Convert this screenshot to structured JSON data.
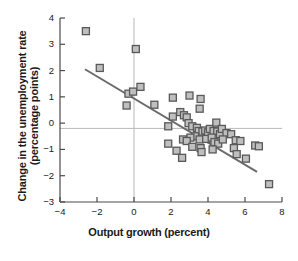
{
  "chart_data": {
    "type": "scatter",
    "title": "",
    "xlabel": "Output growth (percent)",
    "ylabel": "Change in the unemployment rate\n(percentage points)",
    "xlim": [
      -4,
      8
    ],
    "ylim": [
      -3,
      4
    ],
    "xticks": [
      -4,
      -2,
      0,
      2,
      4,
      6,
      8
    ],
    "yticks": [
      4,
      3,
      2,
      1,
      0,
      -1,
      -2,
      -3
    ],
    "xtick_labels": [
      "−4",
      "−2",
      "0",
      "2",
      "4",
      "6",
      "8"
    ],
    "ytick_labels": [
      "4",
      "3",
      "2",
      "1",
      "0",
      "−1",
      "−2",
      "−3"
    ],
    "grid": false,
    "reference_lines": [
      {
        "name": "vertical-zero-line",
        "orientation": "vertical",
        "value": 0
      },
      {
        "name": "horizontal-zero-line",
        "orientation": "horizontal",
        "value": -0.2
      }
    ],
    "legend": [],
    "marker": {
      "shape": "square",
      "fill_color": "#bfbfbf",
      "edge_color": "#595959",
      "size_px": 7
    },
    "trend_line": {
      "name": "regression-line",
      "color": "#6b6b6b",
      "width_px": 2,
      "x_start": -2.65,
      "y_start": 2.05,
      "x_end": 6.65,
      "y_end": -1.85
    },
    "points": [
      {
        "x": -2.6,
        "y": 3.5
      },
      {
        "x": -1.85,
        "y": 2.1
      },
      {
        "x": 0.1,
        "y": 2.82
      },
      {
        "x": -0.3,
        "y": 1.12
      },
      {
        "x": -0.05,
        "y": 1.2
      },
      {
        "x": 0.35,
        "y": 1.38
      },
      {
        "x": -0.4,
        "y": 0.67
      },
      {
        "x": 1.1,
        "y": 0.7
      },
      {
        "x": 2.1,
        "y": 0.97
      },
      {
        "x": 3.0,
        "y": 1.05
      },
      {
        "x": 3.6,
        "y": 0.92
      },
      {
        "x": 3.55,
        "y": 0.55
      },
      {
        "x": 2.1,
        "y": 0.25
      },
      {
        "x": 2.5,
        "y": 0.42
      },
      {
        "x": 2.7,
        "y": 0.3
      },
      {
        "x": 2.85,
        "y": 0.22
      },
      {
        "x": 1.85,
        "y": -0.12
      },
      {
        "x": 2.95,
        "y": 0.0
      },
      {
        "x": 3.15,
        "y": -0.12
      },
      {
        "x": 3.4,
        "y": -0.18
      },
      {
        "x": 3.5,
        "y": -0.3
      },
      {
        "x": 3.7,
        "y": -0.32
      },
      {
        "x": 3.85,
        "y": -0.28
      },
      {
        "x": 4.0,
        "y": -0.35
      },
      {
        "x": 4.1,
        "y": -0.22
      },
      {
        "x": 4.3,
        "y": -0.3
      },
      {
        "x": 4.45,
        "y": 0.02
      },
      {
        "x": 4.5,
        "y": -0.32
      },
      {
        "x": 4.65,
        "y": -0.42
      },
      {
        "x": 4.75,
        "y": -0.22
      },
      {
        "x": 5.0,
        "y": -0.38
      },
      {
        "x": 5.25,
        "y": -0.42
      },
      {
        "x": 3.3,
        "y": -0.5
      },
      {
        "x": 3.05,
        "y": -0.55
      },
      {
        "x": 2.65,
        "y": -0.62
      },
      {
        "x": 2.85,
        "y": -0.68
      },
      {
        "x": 3.55,
        "y": -0.62
      },
      {
        "x": 3.9,
        "y": -0.6
      },
      {
        "x": 4.2,
        "y": -0.55
      },
      {
        "x": 4.35,
        "y": -0.72
      },
      {
        "x": 4.55,
        "y": -0.78
      },
      {
        "x": 4.8,
        "y": -0.62
      },
      {
        "x": 5.5,
        "y": -0.65
      },
      {
        "x": 5.75,
        "y": -0.68
      },
      {
        "x": 6.55,
        "y": -0.85
      },
      {
        "x": 6.75,
        "y": -0.88
      },
      {
        "x": 1.85,
        "y": -0.78
      },
      {
        "x": 2.3,
        "y": -1.05
      },
      {
        "x": 3.15,
        "y": -0.9
      },
      {
        "x": 3.6,
        "y": -0.95
      },
      {
        "x": 3.65,
        "y": -1.1
      },
      {
        "x": 4.25,
        "y": -1.0
      },
      {
        "x": 5.4,
        "y": -0.95
      },
      {
        "x": 5.55,
        "y": -1.18
      },
      {
        "x": 2.6,
        "y": -1.32
      },
      {
        "x": 6.05,
        "y": -1.35
      },
      {
        "x": 7.3,
        "y": -2.32
      }
    ]
  }
}
